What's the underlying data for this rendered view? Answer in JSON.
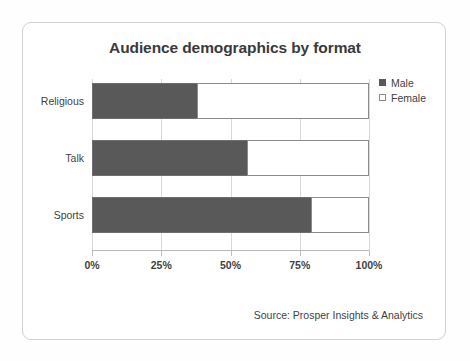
{
  "card": {
    "border_color": "#d2d2d2",
    "background": "#ffffff"
  },
  "chart_data": {
    "type": "bar",
    "orientation": "horizontal",
    "stacked": true,
    "stack_mode": "percent",
    "title": "Audience demographics by format",
    "xlabel": "",
    "ylabel": "",
    "xlim": [
      0,
      100
    ],
    "grid": true,
    "legend_position": "top-right",
    "categories": [
      "Religious",
      "Talk",
      "Sports"
    ],
    "tick_labels": [
      "0%",
      "25%",
      "50%",
      "75%",
      "100%"
    ],
    "tick_values": [
      0,
      25,
      50,
      75,
      100
    ],
    "series": [
      {
        "name": "Male",
        "color": "#595959",
        "values": [
          38,
          56,
          79
        ]
      },
      {
        "name": "Female",
        "color": "#ffffff",
        "values": [
          62,
          44,
          21
        ]
      }
    ],
    "source_note": "Source: Prosper Insights & Analytics"
  },
  "legend": {
    "items": [
      {
        "label": "Male",
        "swatch": "male-swatch-icon"
      },
      {
        "label": "Female",
        "swatch": "female-swatch-icon"
      }
    ]
  }
}
